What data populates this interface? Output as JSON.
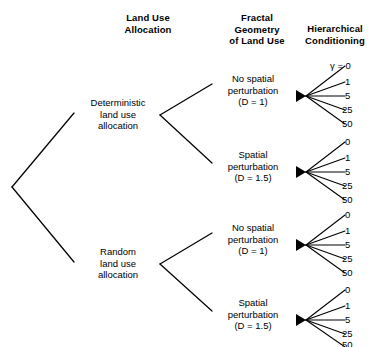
{
  "figure": {
    "type": "tree-diagram",
    "background_color": "#ffffff",
    "line_color": "#000000"
  },
  "columns": [
    {
      "id": "land-use-allocation",
      "line1": "Land Use",
      "line2": "Allocation",
      "line3": ""
    },
    {
      "id": "fractal-geometry",
      "line1": "Fractal",
      "line2": "Geometry",
      "line3": "of Land Use"
    },
    {
      "id": "hierarchical-conditioning",
      "line1": "Hierarchical",
      "line2": "Conditioning",
      "line3": ""
    }
  ],
  "allocation_nodes": [
    {
      "id": "deterministic",
      "line1": "Deterministic",
      "line2": "land use",
      "line3": "allocation"
    },
    {
      "id": "random",
      "line1": "Random",
      "line2": "land use",
      "line3": "allocation"
    }
  ],
  "fractal_nodes": [
    {
      "id": "det-no-perturb",
      "line1": "No spatial",
      "line2": "perturbation",
      "line3": "(D = 1)"
    },
    {
      "id": "det-perturb",
      "line1": "Spatial",
      "line2": "perturbation",
      "line3": "(D = 1.5)"
    },
    {
      "id": "rand-no-perturb",
      "line1": "No spatial",
      "line2": "perturbation",
      "line3": "(D = 1)"
    },
    {
      "id": "rand-perturb",
      "line1": "Spatial",
      "line2": "perturbation",
      "line3": "(D = 1.5)"
    }
  ],
  "leaf_groups": [
    {
      "id": "group-1",
      "parent": "det-no-perturb",
      "symbol": "γ =",
      "values": [
        "γ = 0",
        "1",
        "5",
        "25",
        "50"
      ]
    },
    {
      "id": "group-2",
      "parent": "det-perturb",
      "symbol": "",
      "values": [
        "0",
        "1",
        "5",
        "25",
        "50"
      ]
    },
    {
      "id": "group-3",
      "parent": "rand-no-perturb",
      "symbol": "",
      "values": [
        "0",
        "1",
        "5",
        "25",
        "50"
      ]
    },
    {
      "id": "group-4",
      "parent": "rand-perturb",
      "symbol": "",
      "values": [
        "0",
        "1",
        "5",
        "25",
        "50"
      ]
    }
  ]
}
